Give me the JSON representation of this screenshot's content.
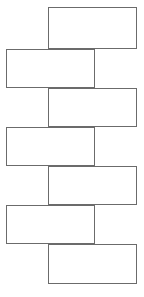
{
  "diagram": {
    "canvas": {
      "width": 144,
      "height": 297,
      "background_color": "#ffffff"
    },
    "style": {
      "stroke_color": "#6b6b6b",
      "stroke_width": 1,
      "fill_color": "#ffffff"
    },
    "layout": "vertical-zigzag-brick-chain",
    "shape_count": 7,
    "shapes": [
      {
        "name": "rectangle-1",
        "label": "",
        "align": "right",
        "x": 48,
        "y": 7,
        "width": 89,
        "height": 42
      },
      {
        "name": "rectangle-2",
        "label": "",
        "align": "left",
        "x": 6,
        "y": 49,
        "width": 89,
        "height": 39
      },
      {
        "name": "rectangle-3",
        "label": "",
        "align": "right",
        "x": 48,
        "y": 88,
        "width": 89,
        "height": 39
      },
      {
        "name": "rectangle-4",
        "label": "",
        "align": "left",
        "x": 6,
        "y": 127,
        "width": 89,
        "height": 39
      },
      {
        "name": "rectangle-5",
        "label": "",
        "align": "right",
        "x": 48,
        "y": 166,
        "width": 89,
        "height": 39
      },
      {
        "name": "rectangle-6",
        "label": "",
        "align": "left",
        "x": 6,
        "y": 205,
        "width": 89,
        "height": 39
      },
      {
        "name": "rectangle-7",
        "label": "",
        "align": "right",
        "x": 48,
        "y": 244,
        "width": 89,
        "height": 40
      }
    ]
  }
}
